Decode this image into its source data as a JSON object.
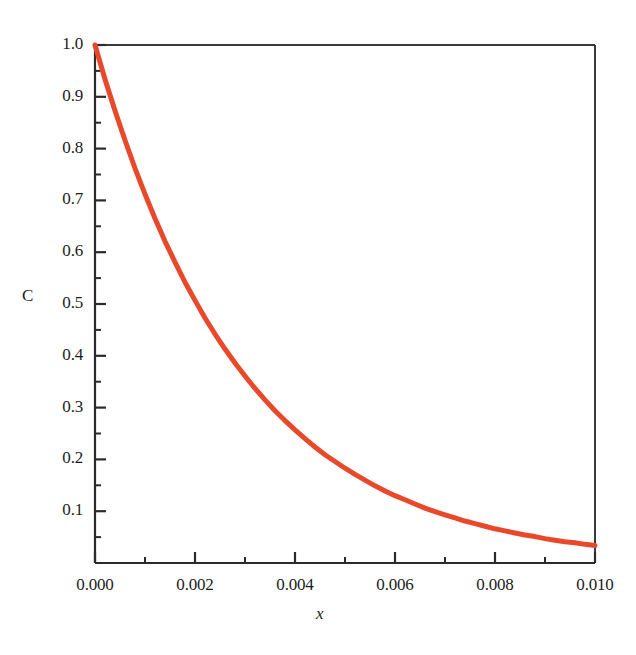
{
  "chart_data": {
    "type": "line",
    "title": "",
    "subtitle": "",
    "xlabel": "x",
    "ylabel": "C",
    "xlim": [
      0.0,
      0.01
    ],
    "ylim": [
      0.0,
      1.0
    ],
    "grid": false,
    "legend": null,
    "series": [
      {
        "name": "C(x)",
        "color": "#e8492b",
        "linewidth": 5,
        "x": [
          0.0,
          0.0002,
          0.0004,
          0.0006,
          0.0008,
          0.001,
          0.0012,
          0.0014,
          0.0016,
          0.0018,
          0.002,
          0.0022,
          0.0024,
          0.0026,
          0.0028,
          0.003,
          0.0032,
          0.0034,
          0.0036,
          0.0038,
          0.004,
          0.0042,
          0.0044,
          0.0046,
          0.0048,
          0.005,
          0.0052,
          0.0054,
          0.0056,
          0.0058,
          0.006,
          0.0062,
          0.0064,
          0.0066,
          0.0068,
          0.007,
          0.0072,
          0.0074,
          0.0076,
          0.0078,
          0.008,
          0.0082,
          0.0084,
          0.0086,
          0.0088,
          0.009,
          0.0092,
          0.0094,
          0.0096,
          0.0098,
          0.01
        ],
        "y": [
          1.0,
          0.934,
          0.873,
          0.816,
          0.762,
          0.712,
          0.665,
          0.621,
          0.581,
          0.542,
          0.507,
          0.473,
          0.442,
          0.413,
          0.386,
          0.361,
          0.337,
          0.315,
          0.294,
          0.275,
          0.257,
          0.24,
          0.224,
          0.209,
          0.196,
          0.183,
          0.171,
          0.16,
          0.149,
          0.139,
          0.13,
          0.122,
          0.114,
          0.106,
          0.099,
          0.093,
          0.087,
          0.081,
          0.076,
          0.071,
          0.066,
          0.062,
          0.058,
          0.054,
          0.051,
          0.047,
          0.044,
          0.041,
          0.039,
          0.036,
          0.034
        ]
      }
    ],
    "xticks": [
      {
        "value": 0.0,
        "label": "0.000"
      },
      {
        "value": 0.002,
        "label": "0.002"
      },
      {
        "value": 0.004,
        "label": "0.004"
      },
      {
        "value": 0.006,
        "label": "0.006"
      },
      {
        "value": 0.008,
        "label": "0.008"
      },
      {
        "value": 0.01,
        "label": "0.010"
      }
    ],
    "xminorticks": [
      0.001,
      0.003,
      0.005,
      0.007,
      0.009
    ],
    "yticks": [
      {
        "value": 1.0,
        "label": "1.0"
      },
      {
        "value": 0.9,
        "label": "0.9"
      },
      {
        "value": 0.8,
        "label": "0.8"
      },
      {
        "value": 0.7,
        "label": "0.7"
      },
      {
        "value": 0.6,
        "label": "0.6"
      },
      {
        "value": 0.5,
        "label": "0.5"
      },
      {
        "value": 0.4,
        "label": "0.4"
      },
      {
        "value": 0.3,
        "label": "0.3"
      },
      {
        "value": 0.2,
        "label": "0.2"
      },
      {
        "value": 0.1,
        "label": "0.1"
      }
    ],
    "yminorticks": [
      0.95,
      0.85,
      0.75,
      0.65,
      0.55,
      0.45,
      0.35,
      0.25,
      0.15,
      0.05
    ],
    "axis_color": "#2b2b2b",
    "background": "#ffffff"
  },
  "labels": {
    "y_axis_title": "C",
    "x_axis_title": "x",
    "y_ticks": [
      "1.0",
      "0.9",
      "0.8",
      "0.7",
      "0.6",
      "0.5",
      "0.4",
      "0.3",
      "0.2",
      "0.1"
    ],
    "x_ticks": [
      "0.000",
      "0.002",
      "0.004",
      "0.006",
      "0.008",
      "0.010"
    ]
  }
}
